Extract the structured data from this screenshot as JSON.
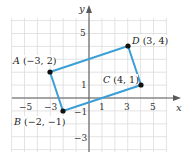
{
  "chart_data": {
    "type": "scatter",
    "title": "",
    "xlabel": "x",
    "ylabel": "y",
    "xlim": [
      -6,
      6
    ],
    "ylim": [
      -4,
      6
    ],
    "grid": true,
    "x_ticks": [
      "-5",
      "-3",
      "1",
      "3",
      "5"
    ],
    "y_ticks": [
      "5",
      "1",
      "-1",
      "-3"
    ],
    "points": [
      {
        "name": "A",
        "x": -3,
        "y": 2,
        "label": "A (−3, 2)"
      },
      {
        "name": "B",
        "x": -2,
        "y": -1,
        "label": "B (−2, −1)"
      },
      {
        "name": "C",
        "x": 4,
        "y": 1,
        "label": "C (4, 1)"
      },
      {
        "name": "D",
        "x": 3,
        "y": 4,
        "label": "D (3, 4)"
      }
    ],
    "polygon": [
      "A",
      "D",
      "C",
      "B"
    ],
    "colors": {
      "edge": "#3a9fd6",
      "point": "#111111",
      "axis": "#5a5a5a",
      "grid": "#dcdcdc"
    }
  },
  "labels": {
    "x_axis": "x",
    "y_axis": "y",
    "x_tick_neg5": "−5",
    "x_tick_neg3": "−3",
    "x_tick_1": "1",
    "x_tick_3": "3",
    "x_tick_5": "5",
    "y_tick_5": "5",
    "y_tick_1": "1",
    "y_tick_neg1": "−1",
    "y_tick_neg3": "−3",
    "point_a_name": "A",
    "point_a_coords": " (−3, 2)",
    "point_b_name": "B",
    "point_b_coords": " (−2, −1)",
    "point_c_name": "C",
    "point_c_coords": " (4, 1)",
    "point_d_name": "D",
    "point_d_coords": " (3, 4)"
  }
}
